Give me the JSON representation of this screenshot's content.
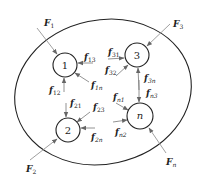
{
  "diagram": {
    "boundary": {
      "shape": "ellipse",
      "cx": 103,
      "cy": 92,
      "rx": 89,
      "ry": 72,
      "rotate": -12
    },
    "nodes": [
      {
        "id": "1",
        "label": "1",
        "cx": 65,
        "cy": 65,
        "r": 12
      },
      {
        "id": "3",
        "label": "3",
        "cx": 137,
        "cy": 55,
        "r": 12
      },
      {
        "id": "2",
        "label": "2",
        "cx": 68,
        "cy": 130,
        "r": 12
      },
      {
        "id": "n",
        "label": "n",
        "cx": 140,
        "cy": 116,
        "r": 13
      }
    ],
    "external_forces": [
      {
        "name": "F1",
        "main": "F",
        "sub": "1",
        "lx": 44,
        "ly": 24
      },
      {
        "name": "F3",
        "main": "F",
        "sub": "3",
        "lx": 173,
        "ly": 25
      },
      {
        "name": "F2",
        "main": "F",
        "sub": "2",
        "lx": 26,
        "ly": 173
      },
      {
        "name": "Fn",
        "main": "F",
        "sub": "n",
        "lx": 165,
        "ly": 165
      }
    ],
    "internal_forces": [
      {
        "name": "f13",
        "main": "f",
        "sub": "13",
        "lx": 84,
        "ly": 60
      },
      {
        "name": "f1n",
        "main": "f",
        "sub": "1n",
        "lx": 90,
        "ly": 88
      },
      {
        "name": "f12",
        "main": "f",
        "sub": "12",
        "lx": 50,
        "ly": 92
      },
      {
        "name": "f31",
        "main": "f",
        "sub": "31",
        "lx": 108,
        "ly": 55
      },
      {
        "name": "f32",
        "main": "f",
        "sub": "32",
        "lx": 106,
        "ly": 73
      },
      {
        "name": "f3n",
        "main": "f",
        "sub": "3n",
        "lx": 144,
        "ly": 80
      },
      {
        "name": "fn3",
        "main": "f",
        "sub": "n3",
        "lx": 146,
        "ly": 96
      },
      {
        "name": "f21",
        "main": "f",
        "sub": "21",
        "lx": 70,
        "ly": 106
      },
      {
        "name": "f23",
        "main": "f",
        "sub": "23",
        "lx": 93,
        "ly": 110
      },
      {
        "name": "f2n",
        "main": "f",
        "sub": "2n",
        "lx": 92,
        "ly": 139
      },
      {
        "name": "fn1",
        "main": "f",
        "sub": "n1",
        "lx": 113,
        "ly": 100
      },
      {
        "name": "fn2",
        "main": "f",
        "sub": "n2",
        "lx": 116,
        "ly": 134
      }
    ]
  }
}
